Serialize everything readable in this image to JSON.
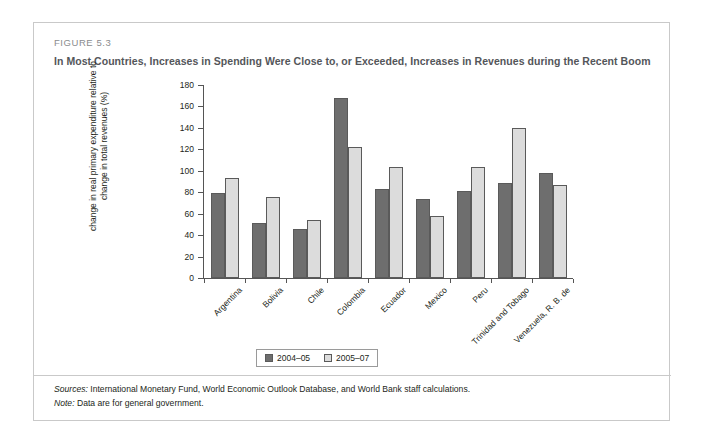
{
  "figure": {
    "number_label": "FIGURE 5.3",
    "title": "In Most Countries, Increases in Spending Were Close to, or Exceeded, Increases in Revenues during the Recent Boom"
  },
  "footer": {
    "sources_key": "Sources:",
    "sources_text": " International Monetary Fund, World Economic Outlook Database, and World Bank staff calculations.",
    "note_key": "Note:",
    "note_text": " Data are for general government."
  },
  "colors": {
    "series_2004_05": "#6e6e6e",
    "series_2005_07": "#dcdcdc",
    "bar_outline": "#5a5a5a",
    "axis": "#555555",
    "card_border": "#c9c9c9",
    "title_text": "#54565a",
    "figure_number_text": "#8a8c8e"
  },
  "chart_data": {
    "type": "bar",
    "title": "In Most Countries, Increases in Spending Were Close to, or Exceeded, Increases in Revenues during the Recent Boom",
    "xlabel": "",
    "ylabel": "change in real primary expenditure relative to change in total revenues (%)",
    "ylim": [
      0,
      180
    ],
    "yticks": [
      0,
      20,
      40,
      60,
      80,
      100,
      120,
      140,
      160,
      180
    ],
    "ytick_labels": [
      "0",
      "20",
      "40",
      "60",
      "80",
      "100",
      "120",
      "140",
      "160",
      "180"
    ],
    "grid": false,
    "legend_position": "bottom-center",
    "categories": [
      "Argentina",
      "Bolivia",
      "Chile",
      "Colombia",
      "Ecuador",
      "Mexico",
      "Peru",
      "Trinidad and Tobago",
      "Venezuela, R. B. de"
    ],
    "series": [
      {
        "name": "2004–05",
        "color": "#6e6e6e",
        "values": [
          79,
          51,
          46,
          168,
          83,
          74,
          81,
          89,
          98
        ]
      },
      {
        "name": "2005–07",
        "color": "#dcdcdc",
        "values": [
          93,
          76,
          54,
          122,
          104,
          58,
          104,
          140,
          87
        ]
      }
    ]
  }
}
